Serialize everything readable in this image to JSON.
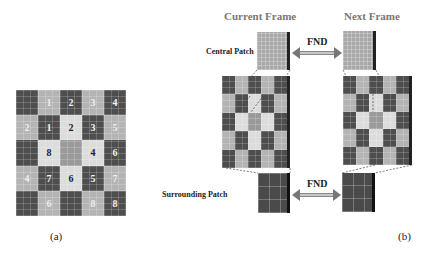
{
  "panel_a": {
    "caption": "(a)",
    "grid": {
      "rows": 5,
      "cols": 5,
      "cells": [
        [
          {
            "shade": "D",
            "label": ""
          },
          {
            "shade": "L",
            "label": "1"
          },
          {
            "shade": "D",
            "label": "2"
          },
          {
            "shade": "L",
            "label": "3"
          },
          {
            "shade": "D",
            "label": "4"
          }
        ],
        [
          {
            "shade": "L",
            "label": "2"
          },
          {
            "shade": "D",
            "label": "1"
          },
          {
            "shade": "V",
            "label": "2"
          },
          {
            "shade": "D",
            "label": "3"
          },
          {
            "shade": "L",
            "label": "5"
          }
        ],
        [
          {
            "shade": "D",
            "label": ""
          },
          {
            "shade": "V",
            "label": "8"
          },
          {
            "shade": "M",
            "label": ""
          },
          {
            "shade": "V",
            "label": "4"
          },
          {
            "shade": "D",
            "label": "6"
          }
        ],
        [
          {
            "shade": "L",
            "label": "4"
          },
          {
            "shade": "D",
            "label": "7"
          },
          {
            "shade": "V",
            "label": "6"
          },
          {
            "shade": "D",
            "label": "5"
          },
          {
            "shade": "L",
            "label": "7"
          }
        ],
        [
          {
            "shade": "D",
            "label": ""
          },
          {
            "shade": "L",
            "label": "6"
          },
          {
            "shade": "D",
            "label": ""
          },
          {
            "shade": "L",
            "label": "8"
          },
          {
            "shade": "D",
            "label": "8"
          }
        ]
      ]
    }
  },
  "panel_b": {
    "caption": "(b)",
    "current_frame_title": "Current Frame",
    "next_frame_title": "Next Frame",
    "central_patch_label": "Central Patch",
    "surrounding_patch_label": "Surrounding Patch",
    "fnd_top": "FND",
    "fnd_bottom": "FND",
    "grid_shades": [
      [
        "D",
        "L",
        "D",
        "L",
        "D"
      ],
      [
        "L",
        "D",
        "V",
        "D",
        "L"
      ],
      [
        "D",
        "V",
        "M",
        "V",
        "D"
      ],
      [
        "L",
        "D",
        "V",
        "D",
        "L"
      ],
      [
        "D",
        "L",
        "D",
        "L",
        "D"
      ]
    ]
  }
}
